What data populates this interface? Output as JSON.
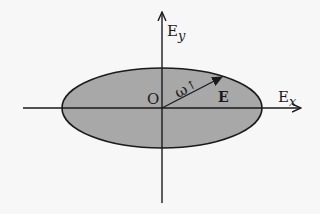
{
  "diagram": {
    "type": "polarization-ellipse",
    "axes": {
      "x_label_main": "E",
      "x_label_sub": "x",
      "y_label_main": "E",
      "y_label_sub": "y"
    },
    "origin_label": "O",
    "vector_label": "E",
    "rotation_label": "ω",
    "rotation_arrow": "↑",
    "colors": {
      "ellipse_fill": "#a8a8a8",
      "stroke": "#1a1a1a",
      "background": "#f7f7f7"
    }
  }
}
